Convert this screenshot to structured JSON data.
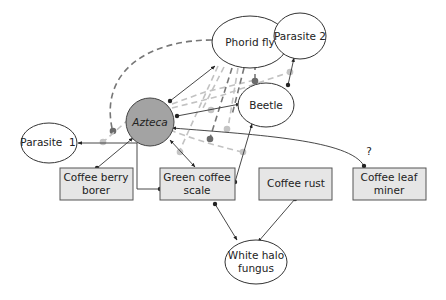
{
  "diagram": {
    "type": "ecological interaction network",
    "nodes": {
      "phorid_fly": {
        "label": "Phorid fly",
        "shape": "ellipse"
      },
      "parasite_2": {
        "label": "Parasite 2",
        "shape": "ellipse"
      },
      "beetle": {
        "label": "Beetle",
        "shape": "ellipse"
      },
      "azteca": {
        "label": "Azteca",
        "shape": "circle",
        "style": "italic",
        "fill": "#a3a3a3"
      },
      "parasite_1": {
        "label": "Parasite  1",
        "shape": "ellipse"
      },
      "coffee_berry_borer": {
        "label_line1": "Coffee berry",
        "label_line2": "borer",
        "shape": "box"
      },
      "green_coffee_scale": {
        "label_line1": "Green coffee",
        "label_line2": "scale",
        "shape": "box"
      },
      "coffee_rust": {
        "label": "Coffee rust",
        "shape": "box"
      },
      "coffee_leaf_miner": {
        "label_line1": "Coffee leaf",
        "label_line2": "miner",
        "shape": "box"
      },
      "white_halo_fungus": {
        "label_line1": "White halo",
        "label_line2": "fungus",
        "shape": "ellipse"
      }
    },
    "edges": {
      "direct": [
        {
          "from": "azteca",
          "to": "phorid_fly"
        },
        {
          "from": "azteca",
          "to": "beetle"
        },
        {
          "from": "azteca",
          "to": "coffee_berry_borer"
        },
        {
          "from": "azteca",
          "to": "green_coffee_scale"
        },
        {
          "from": "green_coffee_scale",
          "to": "parasite_1"
        },
        {
          "from": "beetle",
          "to": "green_coffee_scale"
        },
        {
          "from": "beetle",
          "to": "parasite_2"
        },
        {
          "from": "azteca",
          "to": "coffee_leaf_miner",
          "label": "?"
        },
        {
          "from": "green_coffee_scale",
          "to": "white_halo_fungus"
        },
        {
          "from": "coffee_rust",
          "to": "white_halo_fungus"
        }
      ],
      "indirect_dark_dashed": 4,
      "indirect_light_dashed": 5
    },
    "question_mark": "?",
    "colors": {
      "focal_fill": "#a3a3a3",
      "box_fill": "#e6e6e6",
      "dark_dash": "#777777",
      "light_dash": "#c2c2c2"
    }
  }
}
